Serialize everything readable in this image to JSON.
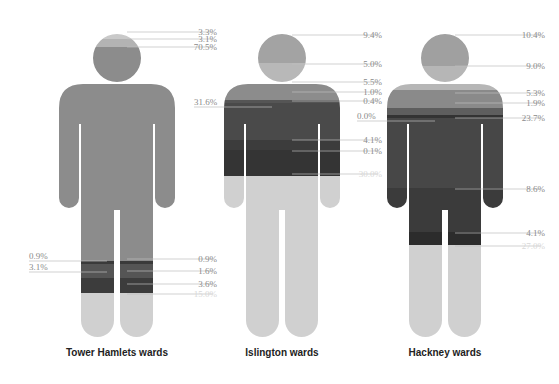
{
  "chart_data": {
    "type": "pictogram-stacked",
    "title": "",
    "figures": [
      {
        "name": "Tower Hamlets wards",
        "center_x": 117,
        "labels_right": [
          {
            "text": "3.3%",
            "y": 35
          },
          {
            "text": "3.1%",
            "y": 42
          },
          {
            "text": "70.5%",
            "y": 50
          },
          {
            "text": "0.9%",
            "y": 262
          },
          {
            "text": "1.6%",
            "y": 274
          },
          {
            "text": "3.6%",
            "y": 287
          },
          {
            "text": "15.0%",
            "y": 297,
            "faint": true
          }
        ],
        "labels_left": [
          {
            "text": "0.9%",
            "y": 259
          },
          {
            "text": "3.1%",
            "y": 270
          }
        ],
        "bands": [
          {
            "from": 34,
            "to": 39,
            "color": "#c9c9c9"
          },
          {
            "from": 39,
            "to": 47,
            "color": "#b3b3b3"
          },
          {
            "from": 47,
            "to": 261,
            "color": "#8c8c8c"
          },
          {
            "from": 261,
            "to": 264,
            "color": "#3a3a3a"
          },
          {
            "from": 264,
            "to": 278,
            "color": "#555555"
          },
          {
            "from": 278,
            "to": 293,
            "color": "#3c3c3c"
          },
          {
            "from": 293,
            "to": 340,
            "color": "#d0d0d0"
          }
        ]
      },
      {
        "name": "Islington wards",
        "center_x": 282,
        "labels_right": [
          {
            "text": "9.4%",
            "y": 38
          },
          {
            "text": "5.0%",
            "y": 67
          },
          {
            "text": "5.5%",
            "y": 85
          },
          {
            "text": "1.0%",
            "y": 95
          },
          {
            "text": "0.4%",
            "y": 104
          },
          {
            "text": "4.1%",
            "y": 143
          },
          {
            "text": "0.1%",
            "y": 154
          },
          {
            "text": "30.0%",
            "y": 177,
            "faint": true
          }
        ],
        "labels_left": [
          {
            "text": "31.6%",
            "y": 105
          }
        ],
        "bands": [
          {
            "from": 34,
            "to": 63,
            "color": "#a3a3a3"
          },
          {
            "from": 63,
            "to": 84,
            "color": "#b8b8b8"
          },
          {
            "from": 84,
            "to": 100,
            "color": "#8c8c8c"
          },
          {
            "from": 100,
            "to": 103,
            "color": "#555555"
          },
          {
            "from": 103,
            "to": 140,
            "color": "#4a4a4a"
          },
          {
            "from": 140,
            "to": 150,
            "color": "#3c3c3c"
          },
          {
            "from": 150,
            "to": 176,
            "color": "#343434"
          },
          {
            "from": 176,
            "to": 340,
            "color": "#d0d0d0"
          }
        ]
      },
      {
        "name": "Hackney wards",
        "center_x": 445,
        "labels_right": [
          {
            "text": "10.4%",
            "y": 38
          },
          {
            "text": "9.0%",
            "y": 69
          },
          {
            "text": "5.3%",
            "y": 96
          },
          {
            "text": "1.9%",
            "y": 106
          },
          {
            "text": "23.7%",
            "y": 121
          },
          {
            "text": "8.6%",
            "y": 192
          },
          {
            "text": "4.1%",
            "y": 236
          },
          {
            "text": "27.0%",
            "y": 249,
            "faint": true
          }
        ],
        "labels_left": [
          {
            "text": "0.0%",
            "y": 119
          }
        ],
        "bands": [
          {
            "from": 34,
            "to": 66,
            "color": "#a0a0a0"
          },
          {
            "from": 66,
            "to": 90,
            "color": "#b6b6b6"
          },
          {
            "from": 90,
            "to": 108,
            "color": "#8a8a8a"
          },
          {
            "from": 108,
            "to": 115,
            "color": "#5e5e5e"
          },
          {
            "from": 115,
            "to": 118,
            "color": "#333333"
          },
          {
            "from": 118,
            "to": 188,
            "color": "#474747"
          },
          {
            "from": 188,
            "to": 232,
            "color": "#3b3b3b"
          },
          {
            "from": 232,
            "to": 245,
            "color": "#2c2c2c"
          },
          {
            "from": 245,
            "to": 340,
            "color": "#d0d0d0"
          }
        ]
      }
    ],
    "xlabel": "",
    "ylabel": ""
  },
  "captions": {
    "tower_hamlets": "Tower Hamlets wards",
    "islington": "Islington wards",
    "hackney": "Hackney wards"
  },
  "colors": {
    "leader_line": "#bdbdbd",
    "label_text": "#8a8a8a",
    "caption_text": "#222222",
    "background": "#ffffff"
  }
}
